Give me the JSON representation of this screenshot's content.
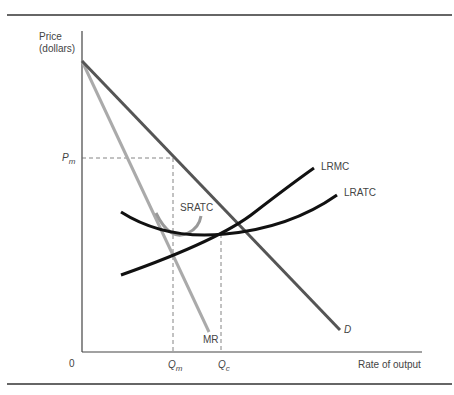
{
  "figure": {
    "y_axis_label_line1": "Price",
    "y_axis_label_line2": "(dollars)",
    "x_axis_label": "Rate of output",
    "origin_label": "0",
    "price_marker": {
      "main": "P",
      "sub": "m"
    },
    "quantity_markers": [
      {
        "main": "Q",
        "sub": "m"
      },
      {
        "main": "Q",
        "sub": "c"
      }
    ],
    "curve_labels": {
      "demand": "D",
      "marginal_revenue": "MR",
      "short_run_atc": "SRATC",
      "long_run_mc": "LRMC",
      "long_run_atc": "LRATC"
    },
    "colors": {
      "demand": "#555555",
      "marginal_revenue": "#aaaaaa",
      "sratc": "#999999",
      "lrmc": "#111111",
      "lratc": "#111111",
      "axes": "#444444",
      "dashed": "#666666"
    }
  }
}
